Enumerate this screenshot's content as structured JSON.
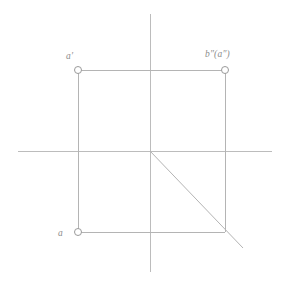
{
  "figure": {
    "type": "orthographic-projection-diagram",
    "width": 293,
    "height": 281,
    "background_color": "#ffffff",
    "line_color": "#b4b4b4",
    "axis_color": "#bcbcbc",
    "marker_stroke_color": "#9a9a9a",
    "label_color": "#8c8c8c"
  },
  "axes": {
    "origin": {
      "x": 150,
      "y": 151
    },
    "vertical": {
      "x": 150,
      "y1": 14,
      "y2": 272
    },
    "horizontal": {
      "y": 151,
      "x1": 18,
      "x2": 272
    }
  },
  "projection_lines": {
    "top_horizontal": {
      "x1": 78,
      "y1": 70,
      "x2": 225,
      "y2": 70
    },
    "left_vertical": {
      "x1": 78,
      "y1": 70,
      "x2": 78,
      "y2": 232
    },
    "right_vertical": {
      "x1": 225,
      "y1": 70,
      "x2": 225,
      "y2": 232
    },
    "bottom_horizontal": {
      "x1": 78,
      "y1": 232,
      "x2": 225,
      "y2": 232
    },
    "diagonal_45": {
      "x1": 150,
      "y1": 151,
      "x2": 243,
      "y2": 248
    }
  },
  "points": [
    {
      "id": "a-prime",
      "label": "a′",
      "x": 78,
      "y": 70,
      "marker": "open-circle",
      "radius": 3.5
    },
    {
      "id": "b2-a2",
      "label": "b″(a″)",
      "x": 225,
      "y": 70,
      "marker": "open-circle",
      "radius": 3.5
    },
    {
      "id": "a",
      "label": "a",
      "x": 78,
      "y": 232,
      "marker": "open-circle",
      "radius": 3.5
    }
  ],
  "labels": {
    "a_prime": "a′",
    "b_double_prime_a_double_prime": "b″(a″)",
    "a": "a"
  }
}
